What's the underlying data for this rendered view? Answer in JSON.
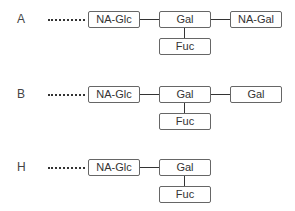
{
  "diagram": {
    "rows": [
      {
        "label": "A",
        "chain": [
          "NA-Glc",
          "Gal",
          "NA-Gal"
        ],
        "branch": "Fuc"
      },
      {
        "label": "B",
        "chain": [
          "NA-Glc",
          "Gal",
          "Gal"
        ],
        "branch": "Fuc"
      },
      {
        "label": "H",
        "chain": [
          "NA-Glc",
          "Gal"
        ],
        "branch": "Fuc"
      }
    ]
  }
}
